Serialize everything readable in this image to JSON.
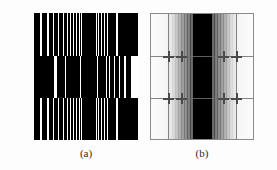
{
  "figure": {
    "background_color": "#fdfdfd",
    "width": 277,
    "height": 170
  },
  "captions": [
    {
      "id": "a",
      "label": "(a)"
    },
    {
      "id": "b",
      "label": "(b)"
    }
  ],
  "panel_a": {
    "name": "chirp-bar-target",
    "description": "Three horizontal bands of vertical black-and-white bars whose spatial frequency increases toward the horizontal center; the middle band is phase-shifted by one half period.",
    "width": 104,
    "height": 127,
    "bar_color": "#000000",
    "gap_color": "#ffffff",
    "bands": [
      {
        "id": "top",
        "top": 0,
        "height": 43,
        "phase_shift": 0,
        "end_block_side": "right"
      },
      {
        "id": "middle",
        "top": 43,
        "height": 42,
        "phase_shift": 1,
        "end_block_side": "left"
      },
      {
        "id": "bottom",
        "top": 85,
        "height": 42,
        "phase_shift": 0,
        "end_block_side": "right"
      }
    ],
    "end_block": {
      "width": 20,
      "color": "#000000"
    }
  },
  "panel_b": {
    "name": "fourier-magnitude-spectrum",
    "description": "Magnitude spectrum of the chirp target: a dark high-energy vertical band at the center, decaying vertical harmonic lines outward, a white background, thin grey grid lines and cross-shaped replica peaks.",
    "width": 104,
    "height": 127,
    "border_color": "#8a8a8a",
    "dc_band_color": "#000000",
    "grid_color": "#6e6e6e",
    "cross_color": "#4a4a4a",
    "grid_lines_horizontal": [
      42,
      84
    ],
    "grid_lines_vertical": [
      17,
      85
    ],
    "cross_positions": [
      {
        "x": 17,
        "y": 42
      },
      {
        "x": 30,
        "y": 42
      },
      {
        "x": 72,
        "y": 42
      },
      {
        "x": 85,
        "y": 42
      },
      {
        "x": 17,
        "y": 84
      },
      {
        "x": 30,
        "y": 84
      },
      {
        "x": 72,
        "y": 84
      },
      {
        "x": 85,
        "y": 84
      }
    ]
  },
  "chart_data": {
    "type": "heatmap",
    "xlabel": "",
    "ylabel": "",
    "panels": [
      {
        "label": "(a)",
        "type": "binary-bar-pattern",
        "note": "Vertical bar widths narrow toward the centre (linear chirp), three stacked bands, centre band shifted half a period.",
        "bar_centers_px": [
          3,
          10,
          17,
          22,
          27,
          31,
          35,
          38,
          41,
          44,
          46.5,
          49,
          51,
          53,
          55,
          57,
          59,
          61,
          63.5,
          66,
          69,
          72,
          76,
          80,
          85,
          91,
          98
        ],
        "bar_widths_px": [
          6,
          5,
          4.5,
          4,
          3.5,
          3,
          2.6,
          2.3,
          2.1,
          1.9,
          1.7,
          1.6,
          1.5,
          1.5,
          1.5,
          1.5,
          1.6,
          1.7,
          1.9,
          2.1,
          2.4,
          2.8,
          3.3,
          4,
          4.8,
          5.6,
          6.4
        ],
        "xlim": [
          0,
          104
        ],
        "ylim": [
          0,
          127
        ],
        "grid": false
      },
      {
        "label": "(b)",
        "type": "spectrum-magnitude",
        "note": "Magnitude |F(u,v)| shown with inverted grey scale: black = high magnitude. Energy concentrated in a broad central vertical band flanked by decaying harmonic lines.",
        "x": [
          0,
          8,
          16,
          22,
          26,
          30,
          34,
          38,
          42,
          46,
          51,
          56,
          60,
          64,
          68,
          72,
          76,
          80,
          86,
          94,
          102
        ],
        "magnitude": [
          0.02,
          0.03,
          0.05,
          0.18,
          0.32,
          0.45,
          0.56,
          0.68,
          0.82,
          0.95,
          1.0,
          0.95,
          0.82,
          0.68,
          0.56,
          0.45,
          0.32,
          0.18,
          0.05,
          0.03,
          0.02
        ],
        "xlim": [
          0,
          104
        ],
        "ylim": [
          0,
          127
        ],
        "grid": true,
        "legend": []
      }
    ]
  }
}
